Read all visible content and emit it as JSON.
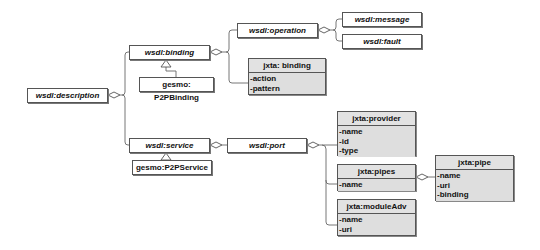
{
  "diagram": {
    "type": "uml-class-diagram",
    "nodes": {
      "description": {
        "label": "wsdl:description"
      },
      "binding": {
        "label": "wsdl:binding"
      },
      "p2pbinding": {
        "label": "gesmo: P2PBinding"
      },
      "operation": {
        "label": "wsdl:operation"
      },
      "message": {
        "label": "wsdl:message"
      },
      "fault": {
        "label": "wsdl:fault"
      },
      "jxta_binding": {
        "label": "jxta: binding",
        "attributes": [
          "-action",
          "-pattern"
        ]
      },
      "service": {
        "label": "wsdl:service"
      },
      "p2pservice": {
        "label": "gesmo:P2PService"
      },
      "port": {
        "label": "wsdl:port"
      },
      "provider": {
        "label": "jxta:provider",
        "attributes": [
          "-name",
          "-id",
          "-type"
        ]
      },
      "pipes": {
        "label": "jxta:pipes",
        "attributes": [
          "-name"
        ]
      },
      "moduleAdv": {
        "label": "jxta:moduleAdv",
        "attributes": [
          "-name",
          "-uri"
        ]
      },
      "pipe": {
        "label": "jxta:pipe",
        "attributes": [
          "-name",
          "-uri",
          "-binding"
        ]
      }
    },
    "edges": [
      {
        "from": "description",
        "to": "binding",
        "kind": "aggregation"
      },
      {
        "from": "description",
        "to": "service",
        "kind": "aggregation"
      },
      {
        "from": "binding",
        "to": "operation",
        "kind": "aggregation"
      },
      {
        "from": "binding",
        "to": "jxta_binding",
        "kind": "aggregation"
      },
      {
        "from": "operation",
        "to": "message",
        "kind": "aggregation"
      },
      {
        "from": "operation",
        "to": "fault",
        "kind": "aggregation"
      },
      {
        "from": "p2pbinding",
        "to": "binding",
        "kind": "generalization"
      },
      {
        "from": "service",
        "to": "port",
        "kind": "aggregation"
      },
      {
        "from": "p2pservice",
        "to": "service",
        "kind": "generalization"
      },
      {
        "from": "port",
        "to": "provider",
        "kind": "aggregation"
      },
      {
        "from": "port",
        "to": "pipes",
        "kind": "aggregation"
      },
      {
        "from": "port",
        "to": "moduleAdv",
        "kind": "aggregation"
      },
      {
        "from": "pipes",
        "to": "pipe",
        "kind": "aggregation"
      }
    ],
    "colors": {
      "border": "#555555",
      "class_fill": "#dcdcdc",
      "box_fill": "#ffffff",
      "line": "#666666"
    }
  }
}
